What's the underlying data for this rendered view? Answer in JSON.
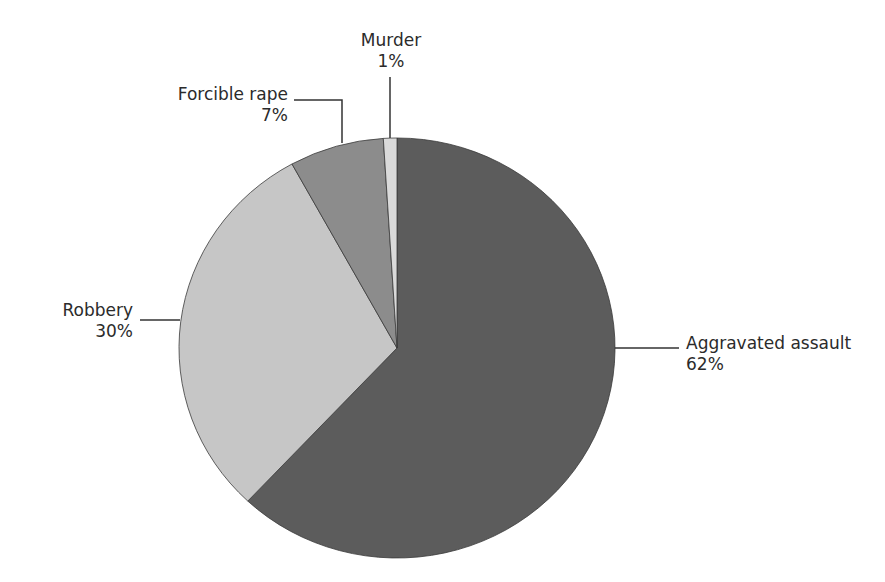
{
  "chart_data": {
    "type": "pie",
    "title": "",
    "categories": [
      "Aggravated assault",
      "Robbery",
      "Forcible rape",
      "Murder"
    ],
    "values": [
      62,
      30,
      7,
      1
    ],
    "unit": "%",
    "colors": [
      "#5c5c5c",
      "#c6c6c6",
      "#8c8c8c",
      "#dadada"
    ],
    "start_angle_deg": -90,
    "direction": "clockwise",
    "labels": [
      {
        "name": "Aggravated assault",
        "pct": "62%"
      },
      {
        "name": "Robbery",
        "pct": "30%"
      },
      {
        "name": "Forcible rape",
        "pct": "7%"
      },
      {
        "name": "Murder",
        "pct": "1%"
      }
    ],
    "legend": "none (leader-line labels)"
  }
}
